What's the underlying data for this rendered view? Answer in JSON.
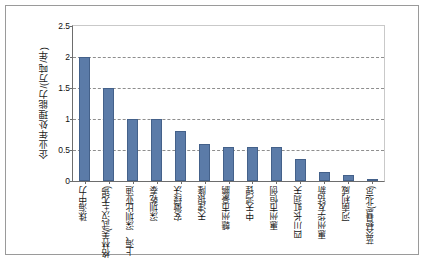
{
  "chart_data": {
    "type": "bar",
    "title": "",
    "xlabel": "",
    "ylabel": "企业年处理能力/(万吨/年)",
    "ylim": [
      0,
      2.5
    ],
    "yticks": [
      "0",
      "0.5",
      "1",
      "1.5",
      "2",
      "2.5"
    ],
    "ytick_values": [
      0,
      0.5,
      1,
      1.5,
      2,
      2.5
    ],
    "grid": "horizontal-dashed",
    "legend": "none",
    "bar_color": "#5b7ba8",
    "bar_edge_color": "#44618a",
    "categories": [
      "珠海中力",
      "格林美(武汉+无锡)",
      "上海、深圳比亚迪",
      "深圳乾泰",
      "安徽绿沃",
      "天津银隆",
      "赣州市豪鹏",
      "中天鸿锂",
      "惠州市恒创",
      "四川长虹润天",
      "惠州华友钴新",
      "河南利威",
      "蓝谷智慧(北京)"
    ],
    "values": [
      2.0,
      1.5,
      1.0,
      1.0,
      0.8,
      0.6,
      0.55,
      0.55,
      0.55,
      0.35,
      0.15,
      0.1,
      0.03
    ]
  }
}
